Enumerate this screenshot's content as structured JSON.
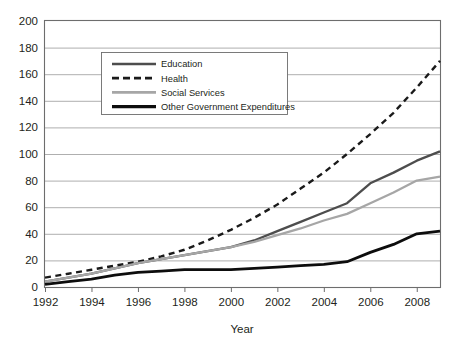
{
  "chart_data": {
    "type": "line",
    "title": "",
    "xlabel": "Year",
    "ylabel": "",
    "xlim": [
      1992,
      2009
    ],
    "ylim": [
      0,
      200
    ],
    "grid": true,
    "legend_position": "upper-left-inside",
    "x_tick_labels": [
      "1992",
      "1994",
      "1996",
      "1998",
      "2000",
      "2002",
      "2004",
      "2006",
      "2008"
    ],
    "x_ticks": [
      1992,
      1994,
      1996,
      1998,
      2000,
      2002,
      2004,
      2006,
      2008
    ],
    "y_tick_labels": [
      "0",
      "20",
      "40",
      "60",
      "80",
      "100",
      "120",
      "140",
      "160",
      "180",
      "200"
    ],
    "y_ticks": [
      0,
      20,
      40,
      60,
      80,
      100,
      120,
      140,
      160,
      180,
      200
    ],
    "x": [
      1992,
      1993,
      1994,
      1995,
      1996,
      1997,
      1998,
      1999,
      2000,
      2001,
      2002,
      2003,
      2004,
      2005,
      2006,
      2007,
      2008,
      2009
    ],
    "series": [
      {
        "name": "Education",
        "color": "#4d4d4d",
        "style": "solid",
        "width": 2.3,
        "values": [
          4,
          7,
          10,
          14,
          18,
          21,
          24,
          27,
          30,
          35,
          42,
          49,
          56,
          63,
          78,
          86,
          95,
          102
        ]
      },
      {
        "name": "Health",
        "color": "#1a1a1a",
        "style": "dashed",
        "width": 2.4,
        "values": [
          7,
          10,
          13,
          16,
          19,
          23,
          28,
          35,
          43,
          52,
          62,
          74,
          86,
          100,
          115,
          131,
          150,
          170
        ]
      },
      {
        "name": "Social Services",
        "color": "#a6a6a6",
        "style": "solid",
        "width": 2.3,
        "values": [
          4,
          7,
          10,
          14,
          18,
          21,
          24,
          27,
          30,
          34,
          39,
          44,
          50,
          55,
          63,
          71,
          80,
          83
        ]
      },
      {
        "name": "Other Government Expenditures",
        "color": "#0d0d0d",
        "style": "solid",
        "width": 2.8,
        "values": [
          2,
          4,
          6,
          9,
          11,
          12,
          13,
          13,
          13,
          14,
          15,
          16,
          17,
          19,
          26,
          32,
          40,
          42
        ]
      }
    ]
  },
  "legend": {
    "items": [
      {
        "label": "Education"
      },
      {
        "label": "Health"
      },
      {
        "label": "Social Services"
      },
      {
        "label": "Other Government Expenditures"
      }
    ]
  },
  "axes": {
    "x_axis_title": "Year"
  }
}
